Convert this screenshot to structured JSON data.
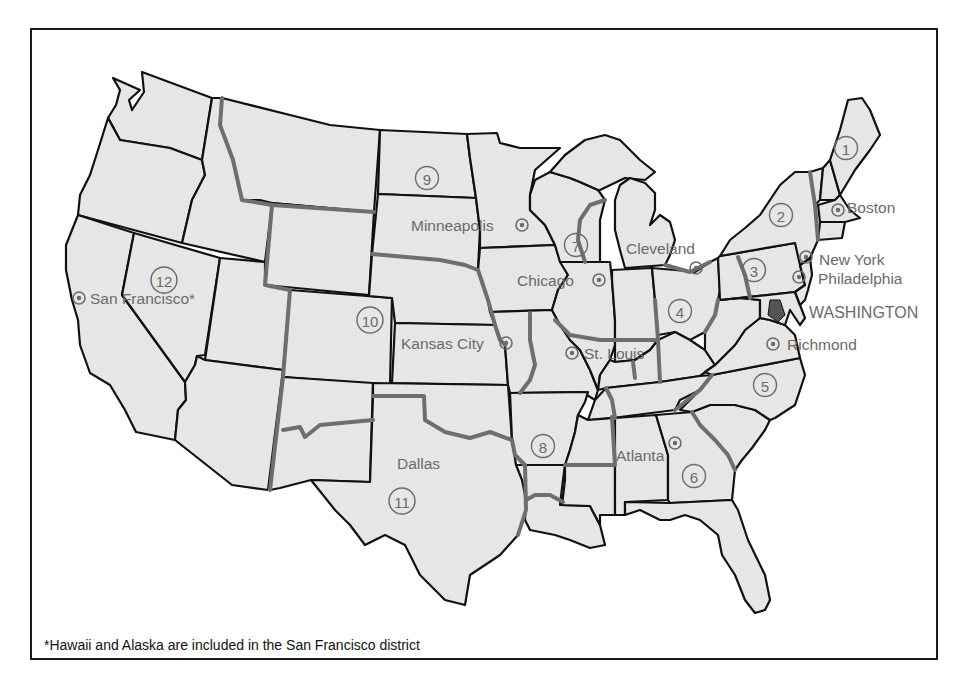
{
  "map": {
    "title": "Federal Reserve Districts",
    "districts": [
      {
        "number": "1",
        "label": "1",
        "x": 846,
        "y": 148
      },
      {
        "number": "2",
        "label": "2",
        "x": 781,
        "y": 215
      },
      {
        "number": "3",
        "label": "3",
        "x": 754,
        "y": 270
      },
      {
        "number": "4",
        "label": "4",
        "x": 680,
        "y": 311
      },
      {
        "number": "5",
        "label": "5",
        "x": 765,
        "y": 385
      },
      {
        "number": "6",
        "label": "6",
        "x": 694,
        "y": 476
      },
      {
        "number": "7",
        "label": "7",
        "x": 576,
        "y": 245
      },
      {
        "number": "8",
        "label": "8",
        "x": 543,
        "y": 446
      },
      {
        "number": "9",
        "label": "9",
        "x": 427,
        "y": 178
      },
      {
        "number": "10",
        "label": "10",
        "x": 370,
        "y": 320
      },
      {
        "number": "11",
        "label": "11",
        "x": 402,
        "y": 501
      },
      {
        "number": "12",
        "label": "12",
        "x": 164,
        "y": 280
      }
    ],
    "cities": [
      {
        "name": "Boston",
        "dot_x": 838,
        "dot_y": 210,
        "label_x": 847,
        "label_y": 213,
        "anchor": "start"
      },
      {
        "name": "New York",
        "dot_x": 806,
        "dot_y": 257,
        "label_x": 819,
        "label_y": 265,
        "anchor": "start"
      },
      {
        "name": "Philadelphia",
        "dot_x": 799,
        "dot_y": 277,
        "label_x": 818,
        "label_y": 284,
        "anchor": "start"
      },
      {
        "name": "WASHINGTON",
        "dot_x": 0,
        "dot_y": 0,
        "label_x": 809,
        "label_y": 318,
        "anchor": "start",
        "no_dot": true
      },
      {
        "name": "Richmond",
        "dot_x": 773,
        "dot_y": 344,
        "label_x": 787,
        "label_y": 350,
        "anchor": "start"
      },
      {
        "name": "Cleveland",
        "dot_x": 696,
        "dot_y": 268,
        "label_x": 626,
        "label_y": 254,
        "anchor": "start"
      },
      {
        "name": "Chicago",
        "dot_x": 599,
        "dot_y": 280,
        "label_x": 517,
        "label_y": 286,
        "anchor": "start"
      },
      {
        "name": "Minneapolis",
        "dot_x": 522,
        "dot_y": 225,
        "label_x": 411,
        "label_y": 231,
        "anchor": "start"
      },
      {
        "name": "Kansas City",
        "dot_x": 506,
        "dot_y": 343,
        "label_x": 401,
        "label_y": 349,
        "anchor": "start"
      },
      {
        "name": "St. Louis",
        "dot_x": 572,
        "dot_y": 353,
        "label_x": 584,
        "label_y": 359,
        "anchor": "start"
      },
      {
        "name": "Atlanta",
        "dot_x": 675,
        "dot_y": 443,
        "label_x": 616,
        "label_y": 461,
        "anchor": "start"
      },
      {
        "name": "Dallas",
        "dot_x": 0,
        "dot_y": 0,
        "label_x": 397,
        "label_y": 469,
        "anchor": "start",
        "no_dot": true
      },
      {
        "name": "San Francisco*",
        "dot_x": 79,
        "dot_y": 298,
        "label_x": 90,
        "label_y": 304,
        "anchor": "start"
      }
    ],
    "footnote": "*Hawaii and Alaska are included in the San Francisco district",
    "colors": {
      "land": "#e6e6e6",
      "state_border": "#111111",
      "district_border": "#6e6e6e",
      "label": "#6a6a6a",
      "dc_fill": "#555555"
    }
  }
}
